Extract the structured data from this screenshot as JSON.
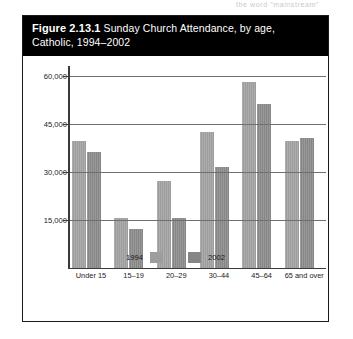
{
  "page_bleed_text": "the word \"mainstream\"",
  "figure": {
    "number_label": "Figure 2.13.1",
    "title_text": " Sunday Church Attendance, by age, Catholic, 1994–2002"
  },
  "colors": {
    "series_1994": "#9d9d9d",
    "series_2002": "#868686",
    "title_bar_background": "#000000",
    "title_bar_text": "#ffffff",
    "frame_border": "#1a1a1a",
    "axis": "#3a3a3a",
    "gridline": "#6f6f6f"
  },
  "chart_data": {
    "type": "bar",
    "title": "Figure 2.13.1 Sunday Church Attendance, by age, Catholic, 1994–2002",
    "xlabel": "",
    "ylabel": "",
    "categories": [
      "Under 15",
      "15–19",
      "20–29",
      "30–44",
      "45–64",
      "65 and over"
    ],
    "series": [
      {
        "name": "1994",
        "values": [
          39500,
          15500,
          27000,
          42500,
          58000,
          39500
        ]
      },
      {
        "name": "2002",
        "values": [
          36000,
          12000,
          15500,
          31500,
          51000,
          40500
        ]
      }
    ],
    "ylim": [
      0,
      63000
    ],
    "yticks": [
      15000,
      30000,
      45000,
      60000
    ],
    "ytick_labels": [
      "15,000",
      "30,000",
      "45,000",
      "60,000"
    ],
    "grid": true,
    "legend_position": "bottom",
    "legend_entries": [
      "1994",
      "2002"
    ]
  }
}
